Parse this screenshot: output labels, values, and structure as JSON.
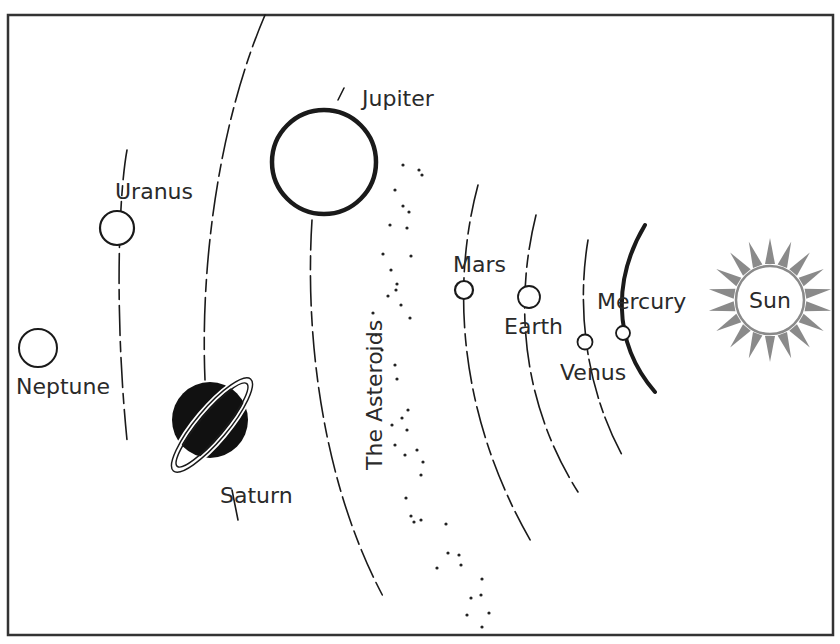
{
  "diagram": {
    "type": "solar-system-illustration",
    "sun": {
      "label": "Sun"
    },
    "planets": [
      {
        "id": "mercury",
        "label": "Mercury"
      },
      {
        "id": "venus",
        "label": "Venus"
      },
      {
        "id": "earth",
        "label": "Earth"
      },
      {
        "id": "mars",
        "label": "Mars"
      },
      {
        "id": "jupiter",
        "label": "Jupiter"
      },
      {
        "id": "saturn",
        "label": "Saturn"
      },
      {
        "id": "uranus",
        "label": "Uranus"
      },
      {
        "id": "neptune",
        "label": "Neptune"
      }
    ],
    "asteroid_belt": {
      "label": "The Asteroids"
    },
    "colors": {
      "ink": "#1a1a1a",
      "sun_rays": "#8a8a8a",
      "background": "#ffffff",
      "frame": "#333333"
    }
  }
}
